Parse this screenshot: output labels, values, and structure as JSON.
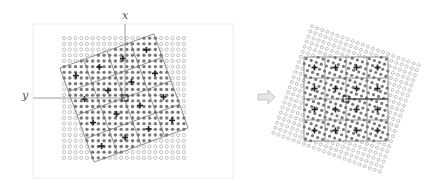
{
  "figure": {
    "left_panel": {
      "x_axis_label": "x",
      "y_axis_label": "y",
      "dot_grid": {
        "cols": 22,
        "rows": 22
      },
      "block_grid": {
        "cols": 4,
        "rows": 4,
        "rotation_deg": -20
      },
      "markers": "cross at center of each block"
    },
    "arrow": {
      "direction": "right",
      "color": "#bdbdbd"
    },
    "right_panel": {
      "dot_grid": {
        "cols": 22,
        "rows": 22,
        "rotation_deg": 20
      },
      "block_grid": {
        "cols": 4,
        "rows": 4,
        "rotation_deg": 0
      },
      "markers": "cross at center of each block"
    },
    "colors": {
      "dot_light": "#b0b0b0",
      "dot_dark": "#7a7a7a",
      "grid_line": "#777777",
      "cross": "#222222",
      "axis": "#888888",
      "background_outline": "#eeeeee"
    }
  }
}
